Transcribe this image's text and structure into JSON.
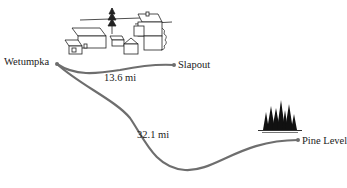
{
  "diagram": {
    "type": "distance-map",
    "origin": {
      "name": "Wetumpka",
      "icon": "town-houses-icon"
    },
    "destinations": [
      {
        "name": "Slapout",
        "distance": "13.6 mi"
      },
      {
        "name": "Pine Level",
        "distance": "32.1 mi",
        "icon": "pine-trees-icon"
      }
    ],
    "route_color": "#6e6e6e"
  }
}
